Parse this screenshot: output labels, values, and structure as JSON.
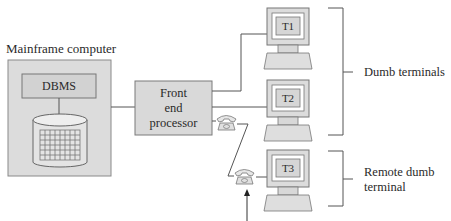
{
  "mainframe": {
    "label": "Mainframe computer",
    "dbms_label": "DBMS"
  },
  "front_end_processor": {
    "line1": "Front",
    "line2": "end",
    "line3": "processor"
  },
  "terminals": [
    {
      "id": "T1",
      "label": "T1"
    },
    {
      "id": "T2",
      "label": "T2"
    },
    {
      "id": "T3",
      "label": "T3"
    }
  ],
  "brackets": {
    "local": {
      "label": "Dumb terminals"
    },
    "remote": {
      "line1": "Remote dumb",
      "line2": "terminal"
    }
  },
  "colors": {
    "box_fill": "#d9d9d9",
    "box_stroke": "#7a7a7a",
    "line": "#555555"
  }
}
